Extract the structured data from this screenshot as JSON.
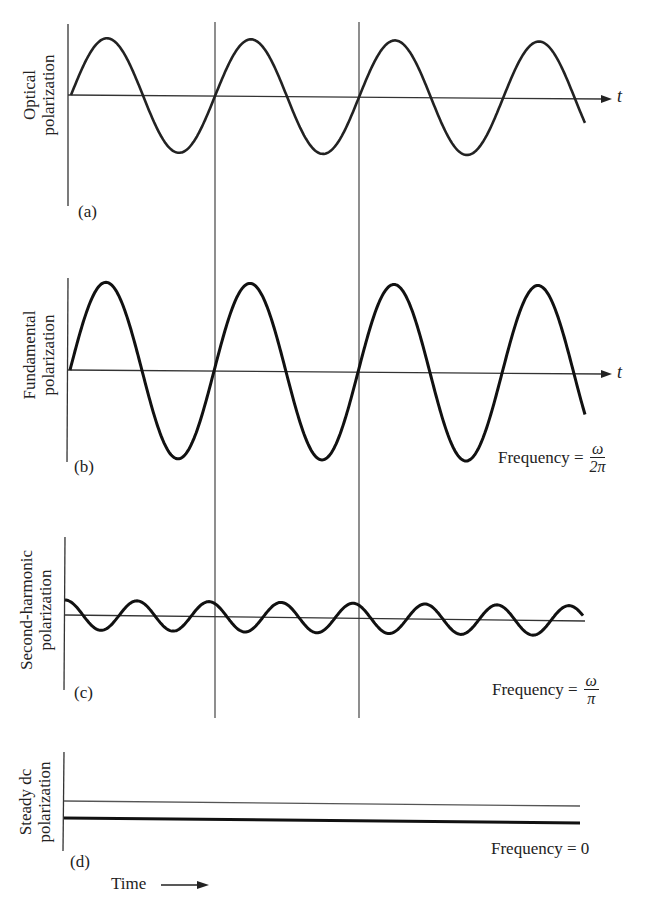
{
  "figure": {
    "panels": [
      {
        "tag": "(a)",
        "ylabel_line1": "Optical",
        "ylabel_line2": "polarization",
        "axis_label": "t",
        "frequency_label": ""
      },
      {
        "tag": "(b)",
        "ylabel_line1": "Fundamental",
        "ylabel_line2": "polarization",
        "axis_label": "t",
        "frequency_label": "Frequency =",
        "freq_num": "ω",
        "freq_den": "2π"
      },
      {
        "tag": "(c)",
        "ylabel_line1": "Second-harmonic",
        "ylabel_line2": "polarization",
        "axis_label": "",
        "frequency_label": "Frequency =",
        "freq_num": "ω",
        "freq_den": "π"
      },
      {
        "tag": "(d)",
        "ylabel_line1": "Steady dc",
        "ylabel_line2": "polarization",
        "axis_label": "",
        "frequency_label": "Frequency = 0"
      }
    ],
    "time_label": "Time",
    "colors": {
      "ink": "#222222",
      "thin_line": "#444444",
      "background": "#ffffff"
    }
  },
  "chart_data": [
    {
      "type": "line",
      "title": "(a) Optical polarization",
      "ylabel": "Optical polarization",
      "xlabel": "t",
      "series": [
        {
          "name": "optical field",
          "shape": "sine",
          "relative_amplitude": 1.0,
          "cycles_shown": 3.75
        }
      ]
    },
    {
      "type": "line",
      "title": "(b) Fundamental polarization",
      "ylabel": "Fundamental polarization",
      "xlabel": "t",
      "annotation": "Frequency = ω/2π",
      "series": [
        {
          "name": "fundamental",
          "shape": "sine",
          "relative_amplitude": 1.0,
          "cycles_shown": 3.75
        }
      ]
    },
    {
      "type": "line",
      "title": "(c) Second-harmonic polarization",
      "ylabel": "Second-harmonic polarization",
      "annotation": "Frequency = ω/π",
      "series": [
        {
          "name": "second harmonic",
          "shape": "cosine",
          "relative_amplitude": 0.17,
          "cycles_shown": 7.5
        }
      ]
    },
    {
      "type": "line",
      "title": "(d) Steady dc polarization",
      "ylabel": "Steady dc polarization",
      "xlabel": "Time",
      "annotation": "Frequency = 0",
      "series": [
        {
          "name": "dc offset",
          "shape": "constant",
          "relative_offset": -0.3
        }
      ]
    }
  ]
}
